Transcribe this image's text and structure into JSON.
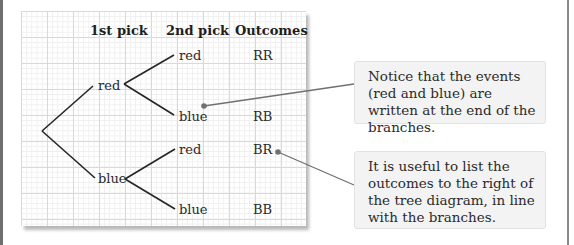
{
  "diagram": {
    "type": "probability-tree",
    "headers": {
      "first_pick": "1st pick",
      "second_pick": "2nd pick",
      "outcomes": "Outcomes"
    },
    "first_level": [
      {
        "label": "red"
      },
      {
        "label": "blue"
      }
    ],
    "second_level": [
      {
        "label": "red",
        "outcome": "RR"
      },
      {
        "label": "blue",
        "outcome": "RB"
      },
      {
        "label": "red",
        "outcome": "BR"
      },
      {
        "label": "blue",
        "outcome": "BB"
      }
    ],
    "colors": {
      "branch": "#262626",
      "connector": "#707070",
      "grid_major": "#d9d9d9",
      "grid_minor": "#efefef",
      "callout_bg": "#f3f3f3"
    }
  },
  "callouts": [
    {
      "text": "Notice that the events (red and blue) are written at the end of the branches."
    },
    {
      "text": "It is useful to list the outcomes to the right of the tree diagram, in line with the branches."
    }
  ]
}
